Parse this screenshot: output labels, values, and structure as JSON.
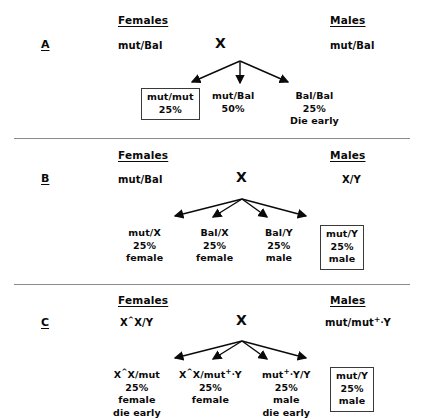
{
  "figure": {
    "headers": {
      "females": "Females",
      "males": "Males"
    },
    "cross_symbol": "X"
  },
  "panels": [
    {
      "letter": "A",
      "parents": {
        "female": "mut/Bal",
        "male": "mut/Bal"
      },
      "arrow_count": 3,
      "offspring": [
        {
          "genotype": "mut/mut",
          "percent": "25%",
          "note": "",
          "boxed": true
        },
        {
          "genotype": "mut/Bal",
          "percent": "50%",
          "note": "",
          "boxed": false
        },
        {
          "genotype": "Bal/Bal",
          "percent": "25%",
          "note": "Die early",
          "boxed": false
        }
      ]
    },
    {
      "letter": "B",
      "parents": {
        "female": "mut/Bal",
        "male": "X/Y"
      },
      "arrow_count": 4,
      "offspring": [
        {
          "genotype": "mut/X",
          "percent": "25%",
          "note": "female",
          "boxed": false
        },
        {
          "genotype": "Bal/X",
          "percent": "25%",
          "note": "female",
          "boxed": false
        },
        {
          "genotype": "Bal/Y",
          "percent": "25%",
          "note": "male",
          "boxed": false
        },
        {
          "genotype": "mut/Y",
          "percent": "25%",
          "note": "male",
          "boxed": true
        }
      ]
    },
    {
      "letter": "C",
      "parents": {
        "female": "X^X/Y",
        "male": "mut/mut+·Y"
      },
      "arrow_count": 4,
      "offspring": [
        {
          "genotype": "X^X/mut",
          "percent": "25%",
          "note": "female",
          "note2": "die early",
          "boxed": false
        },
        {
          "genotype": "X^X/mut+·Y",
          "percent": "25%",
          "note": "female",
          "note2": "",
          "boxed": false
        },
        {
          "genotype": "mut+·Y/Y",
          "percent": "25%",
          "note": "male",
          "note2": "die early",
          "boxed": false
        },
        {
          "genotype": "mut/Y",
          "percent": "25%",
          "note": "male",
          "note2": "",
          "boxed": true
        }
      ]
    }
  ],
  "colors": {
    "ink": "#0a0a0a",
    "divider": "#8c8c8c",
    "box_border": "#3a3a3a",
    "background": "#ffffff"
  }
}
